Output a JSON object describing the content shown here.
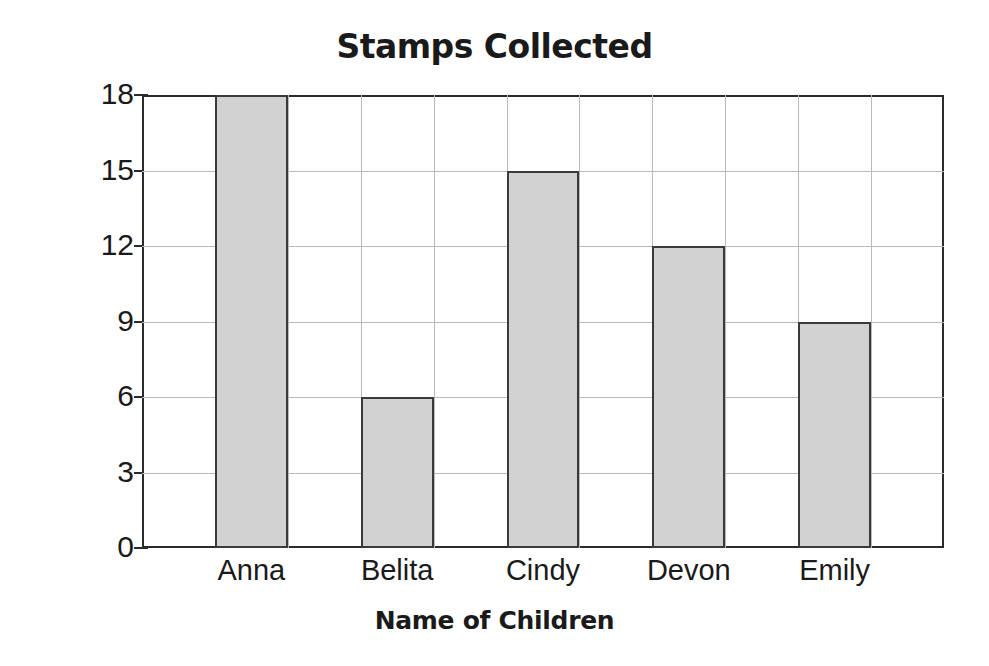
{
  "chart_data": {
    "type": "bar",
    "title": "Stamps Collected",
    "xlabel": "Name of Children",
    "ylabel": "Number of Stamps",
    "categories": [
      "Anna",
      "Belita",
      "Cindy",
      "Devon",
      "Emily"
    ],
    "values": [
      18,
      6,
      15,
      12,
      9
    ],
    "yticks": [
      0,
      3,
      6,
      9,
      12,
      15,
      18
    ],
    "ylim": [
      0,
      18
    ],
    "grid": true,
    "legend": null,
    "bar_fill_color": "#d2d2d2",
    "bar_border_color": "#3a3a3a",
    "gridline_color": "#b9b9b9",
    "axis_color": "#2b2b2b",
    "text_color": "#1a1a1a"
  }
}
